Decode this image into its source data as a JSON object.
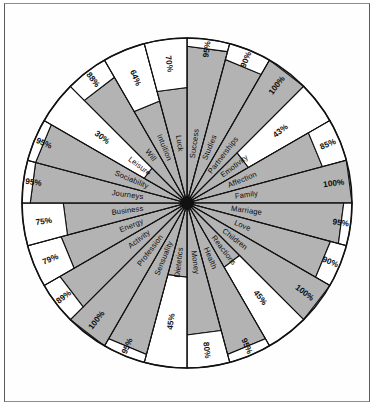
{
  "figure": {
    "kind": "radial-wheel",
    "background_color": "#ffffff",
    "fill_color": "#b3b3b3",
    "empty_color": "#ffffff",
    "line_color": "#111111"
  },
  "chart_data": {
    "type": "pie",
    "title": "",
    "subtitle": "",
    "xlabel": "",
    "ylabel": "",
    "grid": false,
    "legend": "none",
    "units": "%",
    "value_range": [
      0,
      100
    ],
    "sector_count": 24,
    "start_angle_deg": -90,
    "direction": "clockwise",
    "categories": [
      "Success",
      "Studies",
      "Partnerships",
      "Emotivity",
      "Affection",
      "Family",
      "Marriage",
      "Love",
      "Children",
      "Reactions",
      "Health",
      "Money",
      "Dietetics",
      "Sensuality",
      "Profession",
      "Activity",
      "Energy",
      "Business",
      "Journeys",
      "Sociability",
      "Leisure",
      "Will",
      "Intuition",
      "Luck"
    ],
    "values": [
      95,
      90,
      100,
      43,
      85,
      100,
      95,
      90,
      100,
      45,
      95,
      80,
      45,
      95,
      100,
      89,
      79,
      75,
      95,
      95,
      30,
      88,
      64,
      70
    ],
    "value_labels": [
      "95%",
      "90%",
      "100%",
      "43%",
      "85%",
      "100%",
      "95%",
      "90%",
      "100%",
      "45%",
      "95%",
      "80%",
      "45%",
      "95%",
      "100%",
      "89%",
      "79%",
      "75%",
      "95%",
      "95%",
      "30%",
      "88%",
      "64%",
      "70%"
    ],
    "series": [
      {
        "name": "Percentage",
        "values": [
          95,
          90,
          100,
          43,
          85,
          100,
          95,
          90,
          100,
          45,
          95,
          80,
          45,
          95,
          100,
          89,
          79,
          75,
          95,
          95,
          30,
          88,
          64,
          70
        ]
      }
    ]
  }
}
